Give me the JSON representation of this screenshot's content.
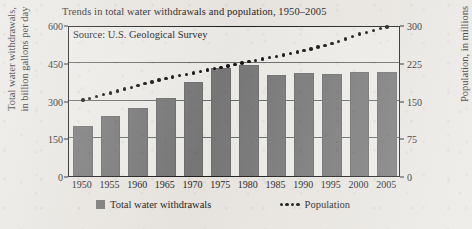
{
  "chart_data": {
    "type": "bar",
    "title": "Trends in total water withdrawals and population, 1950–2005",
    "source_note": "Source: U.S. Geological Survey",
    "categories": [
      "1950",
      "1955",
      "1960",
      "1965",
      "1970",
      "1975",
      "1980",
      "1985",
      "1990",
      "1995",
      "2000",
      "2005"
    ],
    "xlabel": "",
    "ylabel": "Total water withdrawals,\nin billion gallons per day",
    "ylabel_left_line1": "Total water withdrawals,",
    "ylabel_left_line2": "in billion gallons per day",
    "ylabel_right": "Population, in millions",
    "ylim": [
      0,
      600
    ],
    "ylim_right": [
      0,
      300
    ],
    "yticks_left": [
      "0",
      "150",
      "300",
      "450",
      "600"
    ],
    "yticks_right": [
      "0",
      "75",
      "150",
      "225",
      "300"
    ],
    "grid": true,
    "legend_position": "bottom",
    "series": [
      {
        "name": "Total water withdrawals",
        "type": "bar",
        "axis": "left",
        "unit": "billion gallons per day",
        "color": "#787878",
        "values": [
          200,
          240,
          270,
          310,
          375,
          430,
          440,
          400,
          408,
          404,
          412,
          412
        ]
      },
      {
        "name": "Population",
        "type": "line-dotted",
        "axis": "right",
        "unit": "millions",
        "color": "#141414",
        "values": [
          151,
          165,
          180,
          194,
          205,
          216,
          227,
          238,
          249,
          263,
          282,
          296
        ]
      }
    ],
    "legend": [
      {
        "label": "Total water withdrawals",
        "marker": "square-swatch"
      },
      {
        "label": "Population",
        "marker": "dotted-line"
      }
    ]
  },
  "colors": {
    "bar": "#787878",
    "dot": "#141414",
    "paper": "#eae7e2",
    "plot_background": "#eeece8",
    "axis": "#1d1d1d",
    "gridline": "#555555"
  }
}
